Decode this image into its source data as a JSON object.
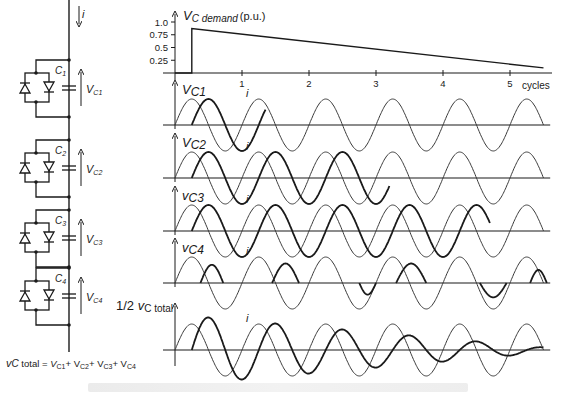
{
  "figure": {
    "circuit": {
      "current_label": "i",
      "modules": [
        {
          "cap_label": "C",
          "cap_sub": "1",
          "volt_label": "V",
          "volt_sub": "C1"
        },
        {
          "cap_label": "C",
          "cap_sub": "2",
          "volt_label": "V",
          "volt_sub": "C2"
        },
        {
          "cap_label": "C",
          "cap_sub": "3",
          "volt_label": "V",
          "volt_sub": "C3"
        },
        {
          "cap_label": "C",
          "cap_sub": "4",
          "volt_label": "V",
          "volt_sub": "C4"
        }
      ],
      "equation": {
        "lhs": "v",
        "lhs_sub": "C",
        "lhs_tail": " total = ",
        "terms": [
          "V",
          "C1",
          "+ V",
          "C2",
          "+ V",
          "C3",
          "+ V",
          "C4"
        ]
      }
    },
    "demand_panel": {
      "title_main": "V",
      "title_sub": "C demand",
      "title_unit": "(p.u.)",
      "y_ticks": [
        "1.0",
        "0.75",
        "0.5",
        "0.25"
      ],
      "x_ticks": [
        "1",
        "2",
        "3",
        "4",
        "5"
      ],
      "x_unit": "cycles"
    },
    "wave_panels": [
      {
        "label_main": "V",
        "label_sub": "C1",
        "curve_label": "i"
      },
      {
        "label_main": "V",
        "label_sub": "C2",
        "curve_label": "i"
      },
      {
        "label_main": "v",
        "label_sub": "C3",
        "curve_label": "i"
      },
      {
        "label_main": "v",
        "label_sub": "C4",
        "curve_label": "i"
      },
      {
        "label_prefix": "1/2 ",
        "label_main": "v",
        "label_sub": "C total",
        "curve_label": "i"
      }
    ]
  },
  "chart_data": [
    {
      "type": "line",
      "title": "V_C demand (p.u.)",
      "xlabel": "cycles",
      "ylabel": "V_C demand (p.u.)",
      "x_ticks": [
        1,
        2,
        3,
        4,
        5
      ],
      "y_ticks": [
        0.25,
        0.5,
        0.75,
        1.0
      ],
      "ylim": [
        0,
        1.0
      ],
      "xlim": [
        0,
        5.5
      ],
      "series": [
        {
          "name": "V_C demand",
          "x": [
            0,
            0.25,
            0.25,
            5.5
          ],
          "y": [
            0,
            0,
            0.87,
            0.1
          ]
        }
      ]
    },
    {
      "type": "line",
      "title": "Module capacitor voltages and current",
      "xlabel": "cycles",
      "xlim": [
        0,
        5.5
      ],
      "panels": [
        {
          "name": "V_C1",
          "current_i": {
            "start": 0,
            "end": 5.5,
            "amplitude": 1
          },
          "voltage": {
            "start": 0.25,
            "end": 1.35,
            "amplitude": 1,
            "phase_lag_cycles": 0.25
          }
        },
        {
          "name": "V_C2",
          "current_i": {
            "start": 0,
            "end": 5.5,
            "amplitude": 1
          },
          "voltage": {
            "start": 0.25,
            "end": 3.2,
            "amplitude": 1,
            "phase_lag_cycles": 0.25
          }
        },
        {
          "name": "v_C3",
          "current_i": {
            "start": 0,
            "end": 5.5,
            "amplitude": 1
          },
          "voltage": {
            "start": 0.25,
            "end": 4.7,
            "amplitude": 1,
            "phase_lag_cycles": 0.25
          }
        },
        {
          "name": "v_C4",
          "current_i": {
            "start": 0,
            "end": 5.5,
            "amplitude": 1
          },
          "voltage": {
            "mode": "pulses",
            "amplitude": 0.55
          }
        },
        {
          "name": "1/2 v_C total",
          "current_i": {
            "start": 0,
            "end": 5.5,
            "amplitude": 1
          },
          "voltage": {
            "start": 0.25,
            "end": 5.5,
            "amplitude_start": 1.3,
            "amplitude_end": 0.1,
            "phase_lag_cycles": 0.25
          }
        }
      ]
    }
  ],
  "layout": {
    "x0": 175,
    "px_per_cycle": 67,
    "demand_axis": {
      "y0": 73,
      "y1": 22
    },
    "panel_baselines": [
      125,
      178,
      231,
      283,
      350
    ],
    "wave_amp_px": 26,
    "total_amp_px": 34,
    "colors": {
      "ink": "#1a1a1a",
      "thin": "#333333"
    }
  }
}
